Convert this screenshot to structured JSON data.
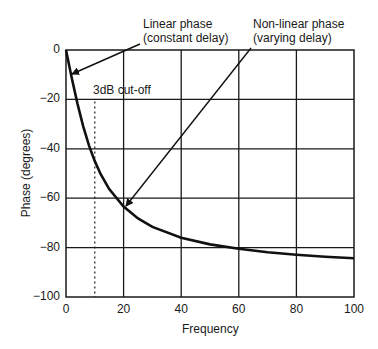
{
  "chart_data": {
    "type": "line",
    "title": "",
    "xlabel": "Frequency",
    "ylabel": "Phase (degrees)",
    "xlim": [
      0,
      100
    ],
    "ylim": [
      -100,
      0
    ],
    "grid": true,
    "x_ticks": [
      "0",
      "20",
      "40",
      "60",
      "80",
      "100"
    ],
    "y_ticks": [
      "0",
      "−20",
      "−40",
      "−60",
      "−80",
      "−100"
    ],
    "series": [
      {
        "name": "Phase response",
        "x": [
          0,
          2,
          4,
          6,
          8,
          10,
          12,
          15,
          20,
          25,
          30,
          40,
          50,
          60,
          70,
          80,
          90,
          100
        ],
        "values": [
          0,
          -11.3,
          -21.8,
          -31.0,
          -38.7,
          -45.0,
          -50.2,
          -56.3,
          -63.4,
          -68.2,
          -71.6,
          -76.0,
          -78.7,
          -80.5,
          -81.9,
          -82.9,
          -83.7,
          -84.3
        ]
      }
    ],
    "annotations": [
      {
        "text": "Linear phase\n(constant delay)",
        "points_to": [
          2,
          -10
        ]
      },
      {
        "text": "Non-linear phase\n(varying delay)",
        "points_to": [
          20,
          -64
        ]
      },
      {
        "text": "3dB cut-off",
        "x": 10,
        "style": "dashed vertical line"
      }
    ]
  },
  "labels": {
    "linear_line1": "Linear phase",
    "linear_line2": "(constant delay)",
    "nonlinear_line1": "Non-linear phase",
    "nonlinear_line2": "(varying delay)",
    "cutoff": "3dB cut-off",
    "xlabel": "Frequency",
    "ylabel": "Phase (degrees)"
  },
  "ticks": {
    "y": [
      "0",
      "−20",
      "−40",
      "−60",
      "−80",
      "−100"
    ],
    "x": [
      "0",
      "20",
      "40",
      "60",
      "80",
      "100"
    ]
  }
}
